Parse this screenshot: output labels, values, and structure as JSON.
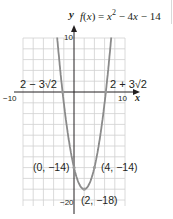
{
  "function": {
    "prefix": "f(x) = x",
    "sup": "2",
    "suffix": " − 4x − 14"
  },
  "axes": {
    "x_label": "x",
    "y_label": "y"
  },
  "ticks": {
    "x_min": "−10",
    "x_max": "10",
    "y_max": "10",
    "y_min": "−20"
  },
  "roots": {
    "left": "2 − 3√2",
    "right": "2 + 3√2"
  },
  "points": {
    "p1": "(0, −14)",
    "p2": "(4, −14)",
    "vertex": "(2, −18)"
  },
  "colors": {
    "curve": "#8a8a8a",
    "grid": "#d0d0d0",
    "axis": "#231f20",
    "point": "#9a9a9a"
  },
  "chart_data": {
    "type": "line",
    "xlabel": "x",
    "ylabel": "y",
    "xlim": [
      -10,
      10
    ],
    "ylim": [
      -20,
      10
    ],
    "grid": true,
    "grid_step": 2,
    "series": [
      {
        "name": "f(x) = x^2 - 4x - 14",
        "x": [
          -3,
          -2.24,
          -2,
          -1,
          0,
          1,
          2,
          3,
          4,
          5,
          6,
          6.24,
          7
        ],
        "y": [
          7,
          0,
          -2,
          -9,
          -14,
          -17,
          -18,
          -17,
          -14,
          -9,
          -2,
          0,
          7
        ]
      }
    ],
    "annotations": [
      {
        "text": "2 − 3√2",
        "x": -2.24,
        "y": 0
      },
      {
        "text": "2 + 3√2",
        "x": 6.24,
        "y": 0
      },
      {
        "text": "(0, −14)",
        "x": 0,
        "y": -14
      },
      {
        "text": "(4, −14)",
        "x": 4,
        "y": -14
      },
      {
        "text": "(2, −18)",
        "x": 2,
        "y": -18
      }
    ],
    "tick_labels": {
      "x": [
        "-10",
        "10"
      ],
      "y": [
        "10",
        "-20"
      ]
    }
  }
}
